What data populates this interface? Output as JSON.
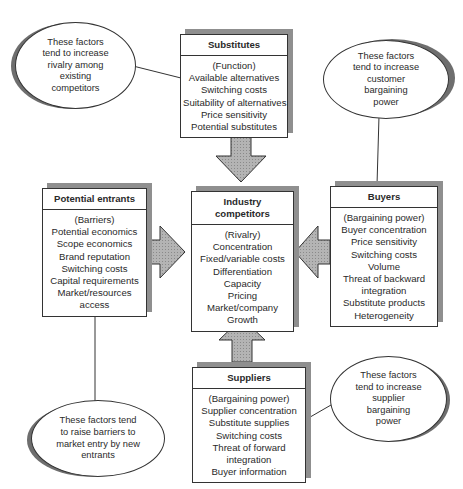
{
  "substitutes": {
    "title": "Substitutes",
    "items": [
      "(Function)",
      "Available alternatives",
      "Switching costs",
      "Suitability of alternatives",
      "Price sensitivity",
      "Potential substitutes"
    ]
  },
  "potential_entrants": {
    "title": "Potential entrants",
    "items": [
      "(Barriers)",
      "Potential economics",
      "Scope economics",
      "Brand reputation",
      "Switching costs",
      "Capital requirements",
      "Market/resources",
      "access"
    ]
  },
  "industry_competitors": {
    "title_line1": "Industry",
    "title_line2": "competitors",
    "items": [
      "(Rivalry)",
      "Concentration",
      "Fixed/variable costs",
      "Differentiation",
      "Capacity",
      "Pricing",
      "Market/company",
      "Growth"
    ]
  },
  "buyers": {
    "title": "Buyers",
    "items": [
      "(Bargaining power)",
      "Buyer concentration",
      "Price sensitivity",
      "Switching costs",
      "Volume",
      "Threat of backward",
      "integration",
      "Substitute products",
      "Heterogeneity"
    ]
  },
  "suppliers": {
    "title": "Suppliers",
    "items": [
      "(Bargaining power)",
      "Supplier concentration",
      "Substitute supplies",
      "Switching costs",
      "Threat of forward",
      "integration",
      "Buyer information"
    ]
  },
  "callouts": {
    "rivalry": [
      "These factors",
      "tend to increase",
      "rivalry among",
      "existing",
      "competitors"
    ],
    "customer": [
      "These factors",
      "tend to increase",
      "customer",
      "bargaining",
      "power"
    ],
    "entry": [
      "These factors tend",
      "to raise barriers to",
      "market entry by new",
      "entrants"
    ],
    "supplier": [
      "These factors",
      "tend to increase",
      "supplier",
      "bargaining",
      "power"
    ]
  },
  "colors": {
    "arrow_fill": "#a9a9a9",
    "shadow": "#8f8f8f",
    "stroke": "#333333"
  }
}
